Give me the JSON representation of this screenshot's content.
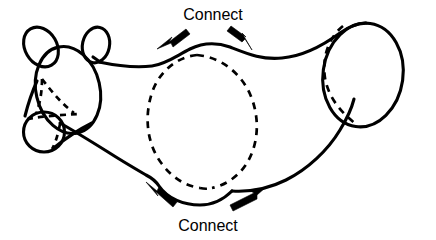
{
  "figure": {
    "background_color": "#ffffff",
    "ink_color": "#000000",
    "width": 436,
    "height": 240
  },
  "labels": {
    "top": {
      "text": "Connect",
      "x": 213,
      "y": 20,
      "font_size": 16
    },
    "bottom": {
      "text": "Connect",
      "x": 208,
      "y": 231,
      "font_size": 16
    }
  },
  "annotations": {
    "arrows": [
      {
        "name": "top-left-arrow",
        "direction": "down-left",
        "tail_x": 186,
        "tail_y": 29,
        "tip_x": 160,
        "tip_y": 48
      },
      {
        "name": "top-right-arrow",
        "direction": "down-right",
        "tail_x": 231,
        "tail_y": 28,
        "tip_x": 251,
        "tip_y": 48
      },
      {
        "name": "bottom-left-arrow",
        "direction": "up-left",
        "tail_x": 172,
        "tail_y": 208,
        "tip_x": 148,
        "tip_y": 184
      },
      {
        "name": "bottom-right-arrow",
        "direction": "up-right",
        "tail_x": 228,
        "tail_y": 211,
        "tip_x": 262,
        "tip_y": 190
      }
    ]
  },
  "shapes": {
    "left_ear": {
      "name": "left-ear",
      "cx": 41,
      "cy": 47,
      "rx": 17,
      "ry": 22,
      "rotation": -28,
      "style": "solid"
    },
    "right_ear": {
      "name": "right-ear",
      "cx": 97,
      "cy": 45,
      "rx": 14,
      "ry": 18,
      "rotation": 13,
      "style": "solid"
    },
    "head": {
      "name": "head-ellipse",
      "cx": 68,
      "cy": 90,
      "rx": 33,
      "ry": 45,
      "rotation": -14,
      "style": "solid"
    },
    "snout": {
      "name": "snout-circle",
      "cx": 44,
      "cy": 132,
      "rx": 21,
      "ry": 20,
      "rotation": 0,
      "style": "solid"
    },
    "snout_hidden_edges": {
      "name": "snout-hidden-edges",
      "style": "dashed"
    },
    "middle_cross_section": {
      "name": "middle-cross-section-ellipse",
      "cx": 207,
      "cy": 117,
      "rx": 57,
      "ry": 62,
      "style": "dashed"
    },
    "right_cap": {
      "name": "right-cap-ellipse",
      "cx": 363,
      "cy": 75,
      "rx": 40,
      "ry": 52,
      "rotation": 8,
      "style": "solid"
    },
    "right_cap_hidden_edge": {
      "name": "right-cap-hidden-arc",
      "style": "dashed"
    },
    "body_outline": {
      "name": "body-outline",
      "style": "solid"
    }
  },
  "semantics": {
    "description": "Line drawing of a tubular animal-like surface with dashed cross-section circles, annotated Connect at top and bottom"
  }
}
